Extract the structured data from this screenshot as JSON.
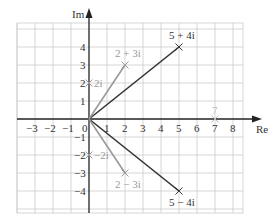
{
  "diagram": {
    "axes": {
      "x_label": "Re",
      "y_label": "Im",
      "x_ticks": [
        "−3",
        "−2",
        "−1",
        "0",
        "1",
        "2",
        "3",
        "4",
        "5",
        "6",
        "7",
        "8"
      ],
      "y_ticks_pos": [
        "1",
        "2",
        "3",
        "4"
      ],
      "y_ticks_neg": [
        "−1",
        "−2",
        "−3",
        "−4"
      ]
    },
    "points": [
      {
        "label": "5 + 4i",
        "re": 5,
        "im": 4,
        "color": "#333333",
        "vector": true
      },
      {
        "label": "5 − 4i",
        "re": 5,
        "im": -4,
        "color": "#333333",
        "vector": true
      },
      {
        "label": "2 + 3i",
        "re": 2,
        "im": 3,
        "color": "#999999",
        "vector": true
      },
      {
        "label": "2 − 3i",
        "re": 2,
        "im": -3,
        "color": "#999999",
        "vector": true
      },
      {
        "label": "2i",
        "re": 0,
        "im": 2,
        "color": "#999999",
        "vector": false
      },
      {
        "label": "−2i",
        "re": 0,
        "im": -2,
        "color": "#999999",
        "vector": false
      },
      {
        "label": "7",
        "re": 7,
        "im": 0,
        "color": "#bbbbbb",
        "vector": false
      }
    ],
    "colors": {
      "grid": "#cccccc",
      "axis": "#222222",
      "dark_vector": "#333333",
      "light_vector": "#999999",
      "faint_point": "#bbbbbb"
    }
  }
}
